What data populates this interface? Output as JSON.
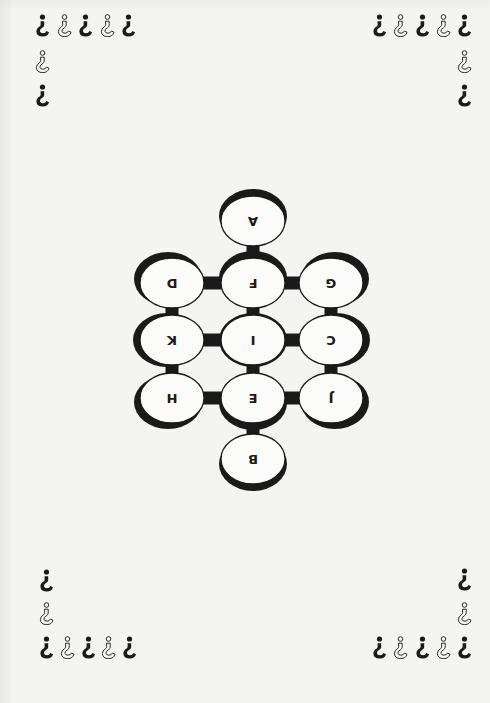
{
  "page": {
    "orientation": "rotated-180",
    "background_color": "#f4f4f2",
    "ink_color": "#1a1a1a"
  },
  "decorations": {
    "glyph_icon": "inverted-question-mark",
    "pattern": [
      "filled",
      "outline",
      "filled",
      "outline",
      "filled"
    ],
    "column_pattern": [
      "filled",
      "outline",
      "filled"
    ],
    "corners": [
      {
        "name": "top-left",
        "row": {
          "x": [
            35,
            57,
            78,
            100,
            121
          ],
          "y": 14
        },
        "column": {
          "x": 35,
          "y": [
            14,
            50,
            84
          ]
        }
      },
      {
        "name": "top-right",
        "row": {
          "x": [
            372,
            393,
            415,
            436,
            457
          ],
          "y": 14
        },
        "column": {
          "x": 457,
          "y": [
            14,
            50,
            84
          ]
        }
      },
      {
        "name": "bottom-left",
        "row": {
          "x": [
            39,
            60,
            81,
            101,
            122
          ],
          "y": 636
        },
        "column": {
          "x": 39,
          "y": [
            569,
            602,
            636
          ]
        }
      },
      {
        "name": "bottom-right",
        "row": {
          "x": [
            372,
            393,
            415,
            436,
            457
          ],
          "y": 636
        },
        "column": {
          "x": 457,
          "y": [
            568,
            602,
            636
          ]
        }
      }
    ]
  },
  "diagram": {
    "title": "",
    "nodes": [
      {
        "id": "A",
        "label": "A",
        "cx": 253,
        "cy": 221,
        "shadow": "top"
      },
      {
        "id": "D",
        "label": "D",
        "cx": 172,
        "cy": 283,
        "shadow": "top-left"
      },
      {
        "id": "F",
        "label": "F",
        "cx": 253,
        "cy": 283,
        "shadow": "top"
      },
      {
        "id": "G",
        "label": "G",
        "cx": 331,
        "cy": 283,
        "shadow": "top-right"
      },
      {
        "id": "K",
        "label": "K",
        "cx": 172,
        "cy": 340,
        "shadow": "left"
      },
      {
        "id": "I",
        "label": "I",
        "cx": 253,
        "cy": 340,
        "shadow": "none"
      },
      {
        "id": "C",
        "label": "C",
        "cx": 331,
        "cy": 340,
        "shadow": "right"
      },
      {
        "id": "H",
        "label": "H",
        "cx": 172,
        "cy": 398,
        "shadow": "bottom-left"
      },
      {
        "id": "E",
        "label": "E",
        "cx": 253,
        "cy": 398,
        "shadow": "bottom"
      },
      {
        "id": "J",
        "label": "J",
        "cx": 331,
        "cy": 398,
        "shadow": "bottom-right"
      },
      {
        "id": "B",
        "label": "B",
        "cx": 253,
        "cy": 459,
        "shadow": "bottom"
      }
    ],
    "edges": [
      [
        "A",
        "F"
      ],
      [
        "D",
        "F"
      ],
      [
        "F",
        "G"
      ],
      [
        "D",
        "K"
      ],
      [
        "F",
        "I"
      ],
      [
        "G",
        "C"
      ],
      [
        "K",
        "I"
      ],
      [
        "I",
        "C"
      ],
      [
        "K",
        "H"
      ],
      [
        "I",
        "E"
      ],
      [
        "C",
        "J"
      ],
      [
        "H",
        "E"
      ],
      [
        "E",
        "J"
      ],
      [
        "E",
        "B"
      ]
    ]
  }
}
